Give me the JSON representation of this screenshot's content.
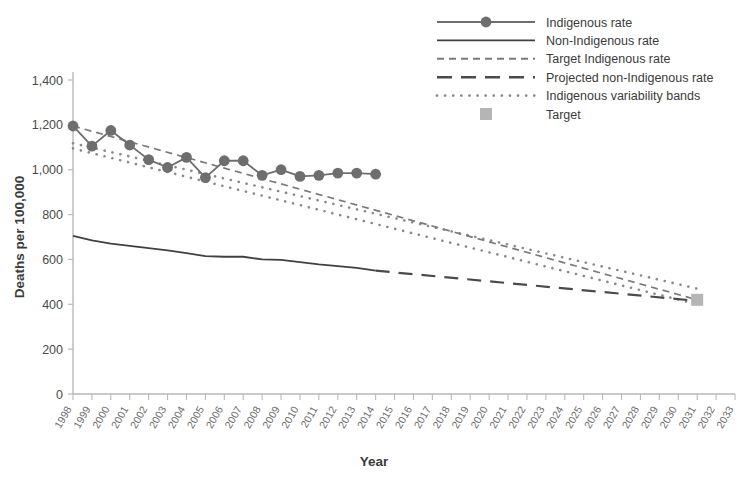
{
  "chart_data": {
    "type": "line",
    "title": "",
    "xlabel": "Year",
    "ylabel": "Deaths per 100,000",
    "xlim": [
      1998,
      2033
    ],
    "ylim": [
      0,
      1400
    ],
    "yticks": [
      0,
      200,
      400,
      600,
      800,
      1000,
      1200,
      1400
    ],
    "ytick_labels": [
      "0",
      "200",
      "400",
      "600",
      "800",
      "1,000",
      "1,200",
      "1,400"
    ],
    "grid": false,
    "legend_position": "top-right",
    "x": [
      1998,
      1999,
      2000,
      2001,
      2002,
      2003,
      2004,
      2005,
      2006,
      2007,
      2008,
      2009,
      2010,
      2011,
      2012,
      2013,
      2014,
      2015,
      2016,
      2017,
      2018,
      2019,
      2020,
      2021,
      2022,
      2023,
      2024,
      2025,
      2026,
      2027,
      2028,
      2029,
      2030,
      2031,
      2032,
      2033
    ],
    "xtick_labels": [
      "1998",
      "1999",
      "2000",
      "2001",
      "2002",
      "2003",
      "2004",
      "2005",
      "2006",
      "2007",
      "2008",
      "2009",
      "2010",
      "2011",
      "2012",
      "2013",
      "2014",
      "2015",
      "2016",
      "2017",
      "2018",
      "2019",
      "2020",
      "2021",
      "2022",
      "2023",
      "2024",
      "2025",
      "2026",
      "2027",
      "2028",
      "2029",
      "2030",
      "2031",
      "2032",
      "2033"
    ],
    "series": [
      {
        "name": "Indigenous rate",
        "style": "solid-marker",
        "color": "#6e6e6e",
        "x": [
          1998,
          1999,
          2000,
          2001,
          2002,
          2003,
          2004,
          2005,
          2006,
          2007,
          2008,
          2009,
          2010,
          2011,
          2012,
          2013,
          2014
        ],
        "values": [
          1195,
          1105,
          1175,
          1110,
          1045,
          1010,
          1055,
          965,
          1040,
          1040,
          975,
          1000,
          970,
          975,
          985,
          985,
          980
        ]
      },
      {
        "name": "Non-Indigenous rate",
        "style": "solid",
        "color": "#404040",
        "x": [
          1998,
          1999,
          2000,
          2001,
          2002,
          2003,
          2004,
          2005,
          2006,
          2007,
          2008,
          2009,
          2010,
          2011,
          2012,
          2013,
          2014
        ],
        "values": [
          705,
          685,
          670,
          660,
          650,
          640,
          628,
          615,
          612,
          612,
          600,
          598,
          588,
          578,
          570,
          562,
          550
        ]
      },
      {
        "name": "Target Indigenous rate",
        "style": "dashed-short",
        "color": "#7a7a7a",
        "x": [
          1998,
          2031
        ],
        "values": [
          1195,
          420
        ]
      },
      {
        "name": "Projected non-Indigenous rate",
        "style": "dashed-long",
        "color": "#4a4a4a",
        "x": [
          2014,
          2031
        ],
        "values": [
          550,
          415
        ]
      },
      {
        "name": "Indigenous variability bands",
        "style": "dotted",
        "color": "#8a8a8a",
        "upper": {
          "x": [
            1998,
            2031
          ],
          "values": [
            1118,
            470
          ]
        },
        "lower": {
          "x": [
            1998,
            2031
          ],
          "values": [
            1095,
            400
          ]
        }
      },
      {
        "name": "Target",
        "style": "square-marker",
        "color": "#b5b5b5",
        "x": [
          2031
        ],
        "values": [
          420
        ]
      }
    ],
    "legend": [
      {
        "label": "Indigenous rate",
        "marker": "line-with-circle",
        "color": "#6e6e6e"
      },
      {
        "label": "Non-Indigenous rate",
        "marker": "line",
        "color": "#404040"
      },
      {
        "label": "Target Indigenous rate",
        "marker": "dashed-short",
        "color": "#7a7a7a"
      },
      {
        "label": "Projected non-Indigenous rate",
        "marker": "dashed-long",
        "color": "#4a4a4a"
      },
      {
        "label": "Indigenous variability bands",
        "marker": "dotted",
        "color": "#8a8a8a"
      },
      {
        "label": "Target",
        "marker": "square",
        "color": "#b5b5b5"
      }
    ]
  }
}
